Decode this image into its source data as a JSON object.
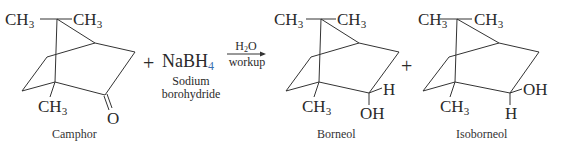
{
  "reaction": {
    "reactant": {
      "name": "Camphor",
      "labels": {
        "methyl_left": "CH",
        "methyl_right": "CH",
        "methyl_bottom": "CH",
        "sub3": "3",
        "carbonyl_o": "O"
      }
    },
    "plus1": "+",
    "reagent": {
      "formula_main": "NaBH",
      "formula_sub": "4",
      "name_line1": "Sodium",
      "name_line2": "borohydride"
    },
    "arrow": {
      "above_main": "H",
      "above_sub": "2",
      "above_tail": "O",
      "below": "workup"
    },
    "product1": {
      "name": "Borneol",
      "labels": {
        "methyl_left": "CH",
        "methyl_right": "CH",
        "methyl_bottom": "CH",
        "sub3": "3",
        "h": "H",
        "oh": "OH"
      }
    },
    "plus2": "+",
    "product2": {
      "name": "Isoborneol",
      "labels": {
        "methyl_left": "CH",
        "methyl_right": "CH",
        "methyl_bottom": "CH",
        "sub3": "3",
        "oh": "OH",
        "h": "H"
      }
    },
    "colors": {
      "ink": "#2a2a2a",
      "subscript_accent": "#3b6fb0"
    }
  }
}
